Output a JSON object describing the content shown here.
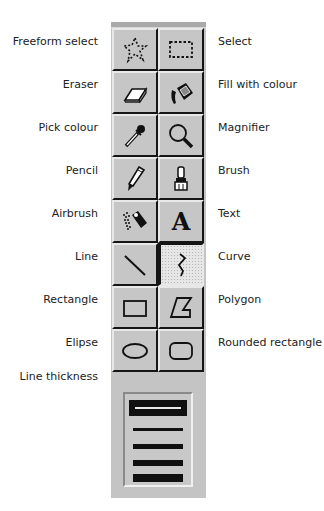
{
  "tools": [
    {
      "row": 0,
      "left": {
        "label": "Freeform select",
        "icon": "freeform-select-icon"
      },
      "right": {
        "label": "Select",
        "icon": "select-icon"
      }
    },
    {
      "row": 1,
      "left": {
        "label": "Eraser",
        "icon": "eraser-icon"
      },
      "right": {
        "label": "Fill with colour",
        "icon": "fill-icon"
      }
    },
    {
      "row": 2,
      "left": {
        "label": "Pick colour",
        "icon": "eyedropper-icon"
      },
      "right": {
        "label": "Magnifier",
        "icon": "magnifier-icon"
      }
    },
    {
      "row": 3,
      "left": {
        "label": "Pencil",
        "icon": "pencil-icon"
      },
      "right": {
        "label": "Brush",
        "icon": "brush-icon"
      }
    },
    {
      "row": 4,
      "left": {
        "label": "Airbrush",
        "icon": "airbrush-icon"
      },
      "right": {
        "label": "Text",
        "icon": "text-icon",
        "glyph": "A"
      }
    },
    {
      "row": 5,
      "left": {
        "label": "Line",
        "icon": "line-icon"
      },
      "right": {
        "label": "Curve",
        "icon": "curve-icon",
        "selected": true
      }
    },
    {
      "row": 6,
      "left": {
        "label": "Rectangle",
        "icon": "rectangle-icon"
      },
      "right": {
        "label": "Polygon",
        "icon": "polygon-icon"
      }
    },
    {
      "row": 7,
      "left": {
        "label": "Elipse",
        "icon": "ellipse-icon"
      },
      "right": {
        "label": "Rounded rectangle",
        "icon": "rounded-rectangle-icon"
      }
    }
  ],
  "line_thickness": {
    "label": "Line thickness",
    "options": [
      1,
      2,
      3,
      4,
      5
    ],
    "selected": 1
  },
  "colors": {
    "toolbox_bg": "#c4c4c4",
    "selected_line": "#101010",
    "highlight": "#e8e8e8",
    "shadow": "#151515"
  }
}
